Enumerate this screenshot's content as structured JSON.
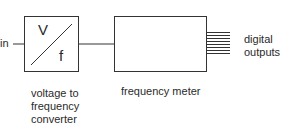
{
  "diagram": {
    "input": {
      "label": "in"
    },
    "blocks": [
      {
        "id": "vf",
        "symbol_top": "V",
        "symbol_bottom": "f",
        "caption_lines": [
          "voltage to",
          "frequency",
          "converter"
        ]
      },
      {
        "id": "fm",
        "caption_lines": [
          "frequency meter"
        ]
      }
    ],
    "outputs": {
      "count": 8,
      "label_lines": [
        "digital",
        "outputs"
      ]
    },
    "colors": {
      "stroke": "#333333",
      "text": "#2a2a2a",
      "background": "#ffffff"
    }
  }
}
